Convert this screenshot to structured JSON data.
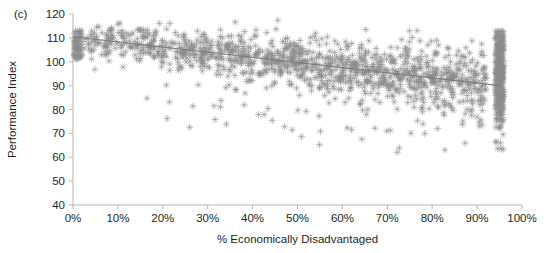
{
  "chart_data": {
    "type": "scatter",
    "title": "",
    "panel_label": "(c)",
    "xlabel": "% Economically Disadvantaged",
    "ylabel": "Performance Index",
    "xlim": [
      0,
      100
    ],
    "ylim": [
      40,
      120
    ],
    "xticks": [
      0,
      10,
      20,
      30,
      40,
      50,
      60,
      70,
      80,
      90,
      100
    ],
    "xtick_labels": [
      "0%",
      "10%",
      "20%",
      "30%",
      "40%",
      "50%",
      "60%",
      "70%",
      "80%",
      "90%",
      "100%"
    ],
    "yticks": [
      40,
      50,
      60,
      70,
      80,
      90,
      100,
      110,
      120
    ],
    "ytick_labels": [
      "40",
      "50",
      "60",
      "70",
      "80",
      "90",
      "100",
      "110",
      "120"
    ],
    "grid": false,
    "legend": null,
    "marker": "asterisk",
    "marker_color": "#8c8c8c",
    "marker_size": 3.6,
    "axis_color": "#b5b5b5",
    "text_color": "#231f20",
    "trendline": {
      "type": "line",
      "color": "#7a7a7a",
      "x": [
        0,
        95
      ],
      "y": [
        110.5,
        90.0
      ],
      "slope": -0.2158,
      "intercept": 110.5
    },
    "n_points": 1600,
    "point_generation": {
      "seed": 20240517,
      "main_cluster": {
        "n": 1180,
        "x_distribution": "beta-like skew across 1 to 92 percent",
        "y_model": "110.5 - 0.216*x + noise",
        "noise_sd_low_x": 3.0,
        "noise_sd_high_x": 7.5
      },
      "left_edge_cluster": {
        "n": 60,
        "x_range": [
          0.2,
          2.0
        ],
        "y_range": [
          101,
          113
        ]
      },
      "right_censored_cluster": {
        "n": 300,
        "x_center": 95.0,
        "x_jitter": 0.9,
        "y_range": [
          45,
          113
        ],
        "y_mode": 93
      },
      "low_outliers": {
        "n": 60,
        "y_range": [
          50,
          80
        ]
      }
    }
  }
}
